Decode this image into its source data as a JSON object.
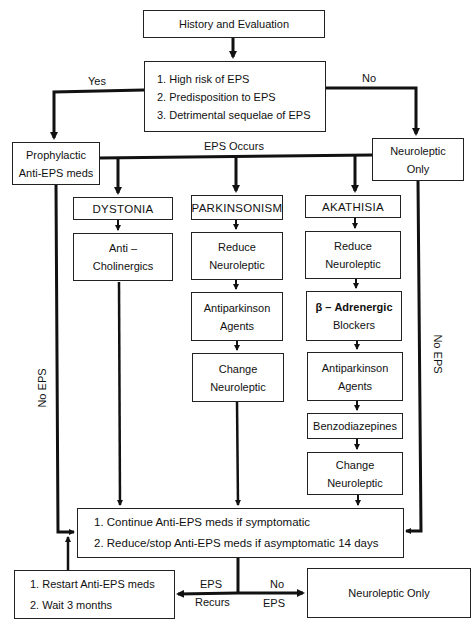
{
  "diagram": {
    "type": "flowchart",
    "topic": "Management of extrapyramidal side effects (EPS)",
    "nodes": {
      "history": {
        "label": "History and Evaluation"
      },
      "criteria": {
        "items": [
          "1.  High risk of EPS",
          "2.  Predisposition to EPS",
          "3.  Detrimental sequelae of EPS"
        ]
      },
      "prophylactic": {
        "lines": [
          "Prophylactic",
          "Anti-EPS meds"
        ]
      },
      "neuroleptic_only_top": {
        "lines": [
          "Neuroleptic",
          "Only"
        ]
      },
      "dystonia": {
        "header": "DYSTONIA",
        "steps": [
          {
            "lines": [
              "Anti –",
              "Cholinergics"
            ]
          }
        ]
      },
      "parkinsonism": {
        "header": "PARKINSONISM",
        "steps": [
          {
            "lines": [
              "Reduce",
              "Neuroleptic"
            ]
          },
          {
            "lines": [
              "Antiparkinson",
              "Agents"
            ]
          },
          {
            "lines": [
              "Change",
              "Neuroleptic"
            ]
          }
        ]
      },
      "akathisia": {
        "header": "AKATHISIA",
        "steps": [
          {
            "lines": [
              "Reduce",
              "Neuroleptic"
            ]
          },
          {
            "lines": [
              "β – Adrenergic",
              "Blockers"
            ]
          },
          {
            "lines": [
              "Antiparkinson",
              "Agents"
            ]
          },
          {
            "lines": [
              "Benzodiazepines"
            ]
          },
          {
            "lines": [
              "Change",
              "Neuroleptic"
            ]
          }
        ]
      },
      "continue": {
        "items": [
          "1.  Continue Anti-EPS meds if symptomatic",
          "2.  Reduce/stop Anti-EPS  meds if asymptomatic  14 days"
        ]
      },
      "restart": {
        "items": [
          "1.  Restart Anti-EPS meds",
          "2.  Wait 3 months"
        ]
      },
      "neuroleptic_only_bottom": {
        "label": "Neuroleptic Only"
      }
    },
    "edge_labels": {
      "yes": "Yes",
      "no": "No",
      "eps_occurs": "EPS  Occurs",
      "no_eps_left": "No EPS",
      "no_eps_right": "No EPS",
      "eps_recurs_top": "EPS",
      "eps_recurs_bottom": "Recurs",
      "no_eps_bottom_top": "No",
      "no_eps_bottom_bottom": "EPS"
    }
  }
}
